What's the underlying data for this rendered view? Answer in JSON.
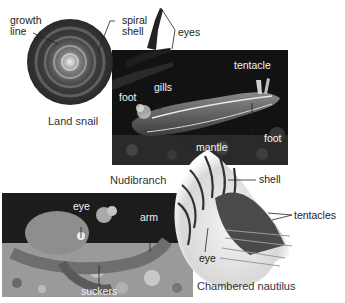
{
  "figure": {
    "panels": [
      {
        "id": "land-snail",
        "caption": "Land snail",
        "labels": [
          "growth line",
          "spiral shell",
          "eyes",
          "foot"
        ]
      },
      {
        "id": "nudibranch",
        "caption": "Nudibranch",
        "labels": [
          "tentacle",
          "gills",
          "foot",
          "mantle"
        ]
      },
      {
        "id": "octopus",
        "caption": "",
        "labels": [
          "eye",
          "arm",
          "suckers"
        ]
      },
      {
        "id": "chambered-nautilus",
        "caption": "Chambered nautilus",
        "labels": [
          "shell",
          "tentacles",
          "eye"
        ]
      }
    ]
  },
  "labels": {
    "growth_1": "growth",
    "growth_2": "line",
    "spiral_1": "spiral",
    "spiral_2": "shell",
    "eyes": "eyes",
    "snail_foot": "foot",
    "tentacle": "tentacle",
    "gills": "gills",
    "nudi_foot": "foot",
    "mantle": "mantle",
    "shell": "shell",
    "tentacles": "tentacles",
    "naut_eye": "eye",
    "oct_eye": "eye",
    "arm": "arm",
    "suckers": "suckers"
  },
  "captions": {
    "land_snail": "Land snail",
    "nudibranch": "Nudibranch",
    "nautilus": "Chambered nautilus"
  },
  "colors": {
    "background": "#ffffff",
    "label_dark": "#222222",
    "label_light": "#f2f2f2",
    "photo_dark": "#141414"
  }
}
